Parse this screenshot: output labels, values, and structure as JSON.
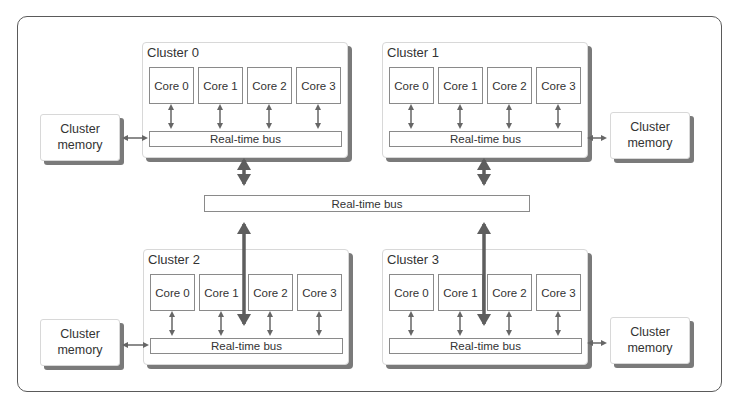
{
  "diagram": {
    "main_bus": {
      "label": "Real-time bus"
    },
    "clusters": [
      {
        "title": "Cluster 0",
        "cores": [
          "Core 0",
          "Core 1",
          "Core 2",
          "Core 3"
        ],
        "bus_label": "Real-time bus",
        "memory_label_line1": "Cluster",
        "memory_label_line2": "memory"
      },
      {
        "title": "Cluster 1",
        "cores": [
          "Core 0",
          "Core 1",
          "Core 2",
          "Core 3"
        ],
        "bus_label": "Real-time bus",
        "memory_label_line1": "Cluster",
        "memory_label_line2": "memory"
      },
      {
        "title": "Cluster 2",
        "cores": [
          "Core 0",
          "Core 1",
          "Core 2",
          "Core 3"
        ],
        "bus_label": "Real-time bus",
        "memory_label_line1": "Cluster",
        "memory_label_line2": "memory"
      },
      {
        "title": "Cluster 3",
        "cores": [
          "Core 0",
          "Core 1",
          "Core 2",
          "Core 3"
        ],
        "bus_label": "Real-time bus",
        "memory_label_line1": "Cluster",
        "memory_label_line2": "memory"
      }
    ],
    "colors": {
      "line": "#666666",
      "border": "#8a8a8a",
      "shadow": "#7a7a7a",
      "frame": "#5a5a5a"
    }
  }
}
